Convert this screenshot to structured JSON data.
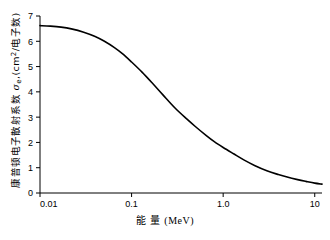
{
  "chart_data": {
    "type": "line",
    "title": "",
    "xlabel": "能量 (MeV)",
    "ylabel": "康普顿电子散射系数 σe (cm2/电子数)",
    "ylabel_parts": {
      "name": "康普顿电子散射系数",
      "symbol": "σ",
      "symbol_sub": "e",
      "unit_open": ",(cm",
      "unit_sup": "2",
      "unit_mid": "/电子数",
      "unit_close": ")"
    },
    "xlabel_parts": {
      "name": "能 量",
      "unit": "(MeV)"
    },
    "xscale": "log",
    "yscale": "linear",
    "xlim": [
      0.01,
      12
    ],
    "ylim": [
      0,
      7
    ],
    "xticks": [
      0.01,
      0.1,
      1.0,
      10
    ],
    "xticklabels": [
      "0.01",
      "0.1",
      "1.0",
      "10"
    ],
    "yticks": [
      0,
      1,
      2,
      3,
      4,
      5,
      6,
      7
    ],
    "yticklabels": [
      "0",
      "1",
      "2",
      "3",
      "4",
      "5",
      "6",
      "7"
    ],
    "grid": false,
    "legend": null,
    "series": [
      {
        "name": "康普顿电子散射系数",
        "x": [
          0.01,
          0.013,
          0.017,
          0.022,
          0.03,
          0.04,
          0.05,
          0.065,
          0.08,
          0.1,
          0.13,
          0.17,
          0.22,
          0.3,
          0.4,
          0.5,
          0.65,
          0.8,
          1.0,
          1.3,
          1.7,
          2.2,
          3.0,
          4.0,
          5.0,
          6.5,
          8.0,
          10.0,
          12.0
        ],
        "y": [
          6.62,
          6.6,
          6.56,
          6.49,
          6.36,
          6.19,
          6.01,
          5.75,
          5.5,
          5.18,
          4.78,
          4.33,
          3.88,
          3.35,
          2.93,
          2.62,
          2.28,
          2.03,
          1.8,
          1.55,
          1.3,
          1.09,
          0.88,
          0.73,
          0.63,
          0.53,
          0.46,
          0.39,
          0.35
        ]
      }
    ]
  },
  "axes": {
    "x_tick_label_0": "0.01",
    "x_tick_label_1": "0.1",
    "x_tick_label_2": "1.0",
    "x_tick_label_3": "10",
    "y_tick_label_0": "0",
    "y_tick_label_1": "1",
    "y_tick_label_2": "2",
    "y_tick_label_3": "3",
    "y_tick_label_4": "4",
    "y_tick_label_5": "5",
    "y_tick_label_6": "6",
    "y_tick_label_7": "7"
  },
  "style": {
    "curve_color": "#000000",
    "axis_color": "#000000",
    "background": "#ffffff"
  }
}
